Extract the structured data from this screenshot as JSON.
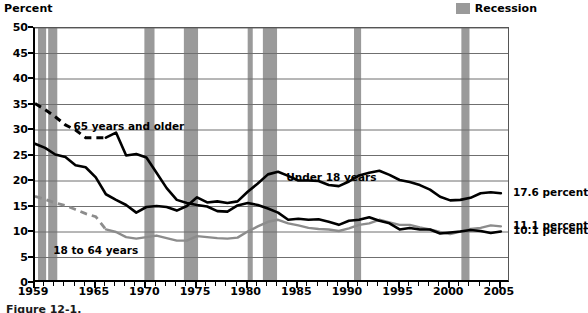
{
  "header": {
    "axis_title": "Percent",
    "legend_label": "Recession",
    "legend_color": "#9a9a9a"
  },
  "caption": "Figure 12-1.",
  "chart_data": {
    "type": "line",
    "title": "",
    "xlabel": "",
    "ylabel": "Percent",
    "xlim": [
      1959,
      2006
    ],
    "ylim": [
      0,
      50
    ],
    "ytick_labels": [
      "0",
      "5",
      "10",
      "15",
      "20",
      "25",
      "30",
      "35",
      "40",
      "45",
      "50"
    ],
    "ytick_values": [
      0,
      5,
      10,
      15,
      20,
      25,
      30,
      35,
      40,
      45,
      50
    ],
    "xtick_labels": [
      "1959",
      "1965",
      "1970",
      "1975",
      "1980",
      "1985",
      "1990",
      "1995",
      "2000",
      "2005"
    ],
    "xtick_values": [
      1959,
      1965,
      1970,
      1975,
      1980,
      1985,
      1990,
      1995,
      2000,
      2005
    ],
    "grid": "horizontal",
    "legend_position": "top-right",
    "x": [
      1959,
      1960,
      1961,
      1962,
      1963,
      1964,
      1965,
      1966,
      1967,
      1968,
      1969,
      1970,
      1971,
      1972,
      1973,
      1974,
      1975,
      1976,
      1977,
      1978,
      1979,
      1980,
      1981,
      1982,
      1983,
      1984,
      1985,
      1986,
      1987,
      1988,
      1989,
      1990,
      1991,
      1992,
      1993,
      1994,
      1995,
      1996,
      1997,
      1998,
      1999,
      2000,
      2001,
      2002,
      2003,
      2004,
      2005
    ],
    "series": [
      {
        "name": "Under 18 years",
        "color": "#000000",
        "style": "solid",
        "end_label": "17.6 percent",
        "end_value": 17.6,
        "values": [
          27.3,
          26.5,
          25.2,
          24.7,
          23.1,
          22.7,
          20.7,
          17.4,
          16.3,
          15.3,
          13.8,
          14.9,
          15.1,
          14.9,
          14.2,
          15.1,
          16.8,
          15.8,
          16.0,
          15.7,
          16.0,
          17.9,
          19.5,
          21.3,
          21.8,
          21.0,
          20.1,
          20.1,
          20.0,
          19.2,
          19.0,
          19.9,
          21.1,
          21.6,
          22.0,
          21.2,
          20.2,
          19.8,
          19.2,
          18.3,
          16.9,
          16.2,
          16.3,
          16.7,
          17.6,
          17.8,
          17.6
        ]
      },
      {
        "name": "18 to 64 years",
        "color": "#8c8c8c",
        "style": "dashed-then-solid",
        "dashed_until": 1966,
        "end_label": "10.1 percent",
        "end_value": 10.1,
        "values": [
          17.0,
          16.4,
          15.7,
          15.2,
          14.4,
          13.6,
          13.0,
          10.5,
          10.0,
          9.0,
          8.7,
          9.0,
          9.3,
          8.8,
          8.3,
          8.3,
          9.2,
          9.0,
          8.8,
          8.7,
          8.9,
          10.1,
          11.1,
          12.0,
          12.4,
          11.7,
          11.3,
          10.8,
          10.6,
          10.5,
          10.2,
          10.7,
          11.4,
          11.7,
          12.4,
          11.9,
          11.4,
          11.4,
          10.9,
          10.5,
          10.0,
          9.6,
          10.1,
          10.6,
          10.8,
          11.3,
          11.1
        ]
      },
      {
        "name": "65 years and older",
        "color": "#000000",
        "style": "dashed-then-solid",
        "dashed_until": 1966,
        "end_label": "11.1 percent",
        "end_value": 11.1,
        "values": [
          35.2,
          34.0,
          32.6,
          31.0,
          30.0,
          28.5,
          28.5,
          28.5,
          29.5,
          25.0,
          25.3,
          24.6,
          21.6,
          18.6,
          16.3,
          15.7,
          15.3,
          15.0,
          14.1,
          14.0,
          15.2,
          15.7,
          15.3,
          14.6,
          13.8,
          12.4,
          12.6,
          12.4,
          12.5,
          12.0,
          11.4,
          12.2,
          12.4,
          12.9,
          12.2,
          11.7,
          10.5,
          10.8,
          10.5,
          10.5,
          9.7,
          9.9,
          10.1,
          10.4,
          10.2,
          9.8,
          10.1
        ]
      }
    ],
    "recession_bands": [
      {
        "start": 1959.3,
        "end": 1960.1
      },
      {
        "start": 1960.3,
        "end": 1961.2
      },
      {
        "start": 1969.8,
        "end": 1970.8
      },
      {
        "start": 1973.7,
        "end": 1975.1
      },
      {
        "start": 1980.0,
        "end": 1980.5
      },
      {
        "start": 1981.5,
        "end": 1982.9
      },
      {
        "start": 1990.5,
        "end": 1991.2
      },
      {
        "start": 2001.1,
        "end": 2001.9
      }
    ],
    "annotations": [
      {
        "text": "65 years and older",
        "x": 1963.0,
        "y": 30.5
      },
      {
        "text": "Under 18 years",
        "x": 1984.0,
        "y": 20.6
      },
      {
        "text": "18 to 64 years",
        "x": 1961.0,
        "y": 6.3
      }
    ]
  }
}
